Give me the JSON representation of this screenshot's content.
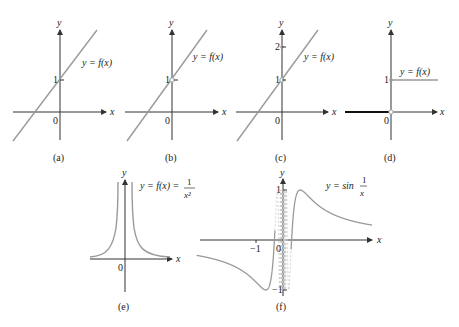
{
  "figure": {
    "panels": [
      {
        "id": "a",
        "caption": "(a)",
        "function_label": "y = f(x)",
        "y_tick": "1",
        "origin": "0",
        "x_axis": "x",
        "y_axis": "y"
      },
      {
        "id": "b",
        "caption": "(b)",
        "function_label": "y = f(x)",
        "y_tick": "1",
        "origin": "0",
        "x_axis": "x",
        "y_axis": "y",
        "note": "open circle at (0,1)"
      },
      {
        "id": "c",
        "caption": "(c)",
        "function_label": "y = f(x)",
        "y_ticks": [
          "1",
          "2"
        ],
        "origin": "0",
        "x_axis": "x",
        "y_axis": "y",
        "note": "open circle at (0,1), filled point at (0,2)"
      },
      {
        "id": "d",
        "caption": "(d)",
        "function_label": "y = f(x)",
        "y_tick": "1",
        "origin": "0",
        "x_axis": "x",
        "y_axis": "y",
        "note": "step function: 0 for x<0, 1 for x>=0"
      },
      {
        "id": "e",
        "caption": "(e)",
        "function_label_prefix": "y = f(x) =",
        "numerator": "1",
        "denominator": "x²",
        "origin": "0",
        "x_axis": "x",
        "y_axis": "y"
      },
      {
        "id": "f",
        "caption": "(f)",
        "function_label_prefix": "y = sin",
        "numerator": "1",
        "denominator": "x",
        "y_ticks": [
          "1",
          "−1"
        ],
        "x_tick": "−1",
        "origin": "0",
        "x_axis": "x",
        "y_axis": "y"
      }
    ]
  },
  "colors": {
    "curve": "#9a9a9a",
    "axis": "#333333",
    "step_left": "#111111"
  }
}
